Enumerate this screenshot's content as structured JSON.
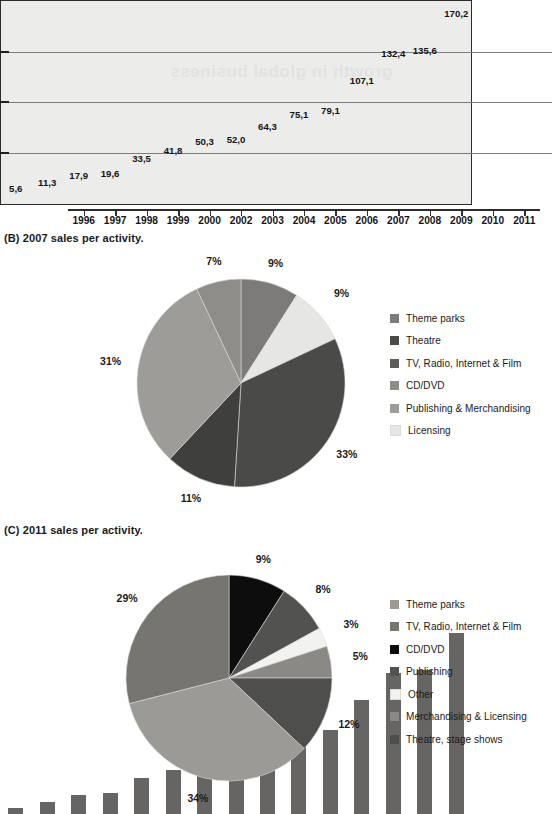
{
  "sections": {
    "b_caption": "(B) 2007 sales per activity.",
    "c_caption": "(C) 2011 sales per activity.",
    "bar_watermark": "growth in global business"
  },
  "colors": {
    "bar_fill": "#666563",
    "panel_bg": "#ececeb",
    "frame": "#2b2b2b",
    "gridline": "#7d7d7d",
    "pieB": [
      "#7c7b79",
      "#e6e6e4",
      "#4a4a48",
      "#3f3f3d",
      "#9d9c99",
      "#8e8d8a"
    ],
    "pieC": [
      "#0d0d0d",
      "#525250",
      "#f2f2f0",
      "#8a8986",
      "#4e4e4c",
      "#9b9a97",
      "#76756f"
    ]
  },
  "chart_data": [
    {
      "type": "bar",
      "title": "",
      "xlabel": "",
      "ylabel": "",
      "ylim": [
        0,
        190
      ],
      "grid": true,
      "gridlines": [
        47.5,
        95,
        142.5
      ],
      "categories": [
        "1996",
        "1997",
        "1998",
        "1999",
        "2000",
        "2002",
        "2003",
        "2004",
        "2005",
        "2006",
        "2007",
        "2008",
        "2009",
        "2010",
        "2011"
      ],
      "values": [
        5.6,
        11.3,
        17.9,
        19.6,
        33.5,
        41.8,
        50.3,
        52.0,
        64.3,
        75.1,
        79.1,
        107.1,
        132.4,
        135.6,
        170.2
      ],
      "value_labels": [
        "5,6",
        "11,3",
        "17,9",
        "19,6",
        "33,5",
        "41,8",
        "50,3",
        "52,0",
        "64,3",
        "75,1",
        "79,1",
        "107,1",
        "132,4",
        "135,6",
        "170,2"
      ]
    },
    {
      "type": "pie",
      "title": "(B) 2007 sales per activity.",
      "legend_position": "right",
      "labels": [
        "Theme parks",
        "Licensing",
        "Theatre",
        "TV, Radio, Internet & Film",
        "Publishing & Merchandising",
        "CD/DVD"
      ],
      "values": [
        9,
        9,
        33,
        11,
        31,
        7
      ],
      "value_labels": [
        "9%",
        "9%",
        "33%",
        "11%",
        "31%",
        "7%"
      ],
      "legend": [
        {
          "label": "Theme parks",
          "color": "#7c7b79"
        },
        {
          "label": "Theatre",
          "color": "#4a4a48"
        },
        {
          "label": "TV, Radio, Internet & Film",
          "color": "#5d5c5a"
        },
        {
          "label": "CD/DVD",
          "color": "#8e8d8a"
        },
        {
          "label": "Publishing & Merchandising",
          "color": "#9d9c99"
        },
        {
          "label": "Licensing",
          "color": "#e6e6e4"
        }
      ]
    },
    {
      "type": "pie",
      "title": "(C) 2011 sales per activity.",
      "legend_position": "right",
      "labels": [
        "CD/DVD",
        "Publishing",
        "Other",
        "Merchandising & Licensing",
        "Theatre, stage shows",
        "Theme parks",
        "TV, Radio, Internet & Film"
      ],
      "values": [
        9,
        8,
        3,
        5,
        12,
        34,
        29
      ],
      "value_labels": [
        "9%",
        "8%",
        "3%",
        "5%",
        "12%",
        "34%",
        "29%"
      ],
      "legend": [
        {
          "label": "Theme parks",
          "color": "#9b9a97"
        },
        {
          "label": "TV, Radio, Internet & Film",
          "color": "#76756f"
        },
        {
          "label": "CD/DVD",
          "color": "#0d0d0d"
        },
        {
          "label": "Publishing",
          "color": "#525250"
        },
        {
          "label": "Other",
          "color": "#f2f2f0"
        },
        {
          "label": "Merchandising & Licensing",
          "color": "#8a8986"
        },
        {
          "label": "Theatre, stage shows",
          "color": "#4e4e4c"
        }
      ]
    }
  ]
}
